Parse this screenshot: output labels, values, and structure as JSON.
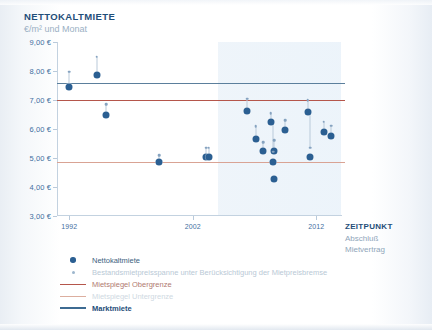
{
  "header": {
    "title": "NETTOKALTMIETE",
    "subtitle": "€/m² und Monat"
  },
  "x_axis_caption": {
    "title": "ZEITPUNKT",
    "line2": "Abschluß",
    "line3": "Mietvertrag"
  },
  "legend": {
    "items": [
      {
        "label": "Nettokaltmiete",
        "marker": "dot",
        "color": "#2b5f92"
      },
      {
        "label": "Bestandsmietpreisspanne unter Berücksichtigung der Mietpreisbremse",
        "marker": "small-dot",
        "color": "#9db6cd"
      },
      {
        "label": "Mietspiegel Obergrenze",
        "marker": "line",
        "color": "#b5564b"
      },
      {
        "label": "Mietspiegel Untergrenze",
        "marker": "line",
        "color": "#dcae9f"
      },
      {
        "label": "Marktmiete",
        "marker": "line",
        "color": "#3d6b92"
      }
    ]
  },
  "chart_data": {
    "type": "scatter",
    "title": "NETTOKALTMIETE",
    "subtitle": "€/m² und Monat",
    "xlabel": "ZEITPUNKT Abschluß Mietvertrag",
    "ylabel": "€/m² und Monat",
    "xlim": [
      1991,
      2014
    ],
    "ylim": [
      3.0,
      9.0
    ],
    "ytick_labels": [
      "3,00 €",
      "4,00 €",
      "5,00 €",
      "6,00 €",
      "7,00 €",
      "8,00 €",
      "9,00 €"
    ],
    "ytick_values": [
      3,
      4,
      5,
      6,
      7,
      8,
      9
    ],
    "xtick_labels": [
      "1992",
      "2002",
      "2012"
    ],
    "xtick_values": [
      1992,
      2002,
      2012
    ],
    "grid": false,
    "legend_position": "below",
    "reference_lines": [
      {
        "name": "Marktmiete",
        "value": 7.6,
        "color": "#3d6b92"
      },
      {
        "name": "Mietspiegel Obergrenze",
        "value": 7.0,
        "color": "#b5564b"
      },
      {
        "name": "Mietspiegel Untergrenze",
        "value": 4.85,
        "color": "#dcae9f"
      }
    ],
    "shaded_region": {
      "from": 2004,
      "to": 2014,
      "color": "#e4eef7"
    },
    "series": [
      {
        "name": "Nettokaltmiete",
        "color": "#2b5f92",
        "points": [
          {
            "x": 1992.0,
            "y": 7.45
          },
          {
            "x": 1994.2,
            "y": 7.85
          },
          {
            "x": 1995.0,
            "y": 6.47
          },
          {
            "x": 1999.3,
            "y": 4.87
          },
          {
            "x": 2003.1,
            "y": 5.05
          },
          {
            "x": 2003.3,
            "y": 5.05
          },
          {
            "x": 2006.4,
            "y": 6.63
          },
          {
            "x": 2007.1,
            "y": 5.65
          },
          {
            "x": 2007.7,
            "y": 5.25
          },
          {
            "x": 2008.3,
            "y": 6.25
          },
          {
            "x": 2008.6,
            "y": 5.25
          },
          {
            "x": 2008.5,
            "y": 4.85
          },
          {
            "x": 2008.6,
            "y": 4.28
          },
          {
            "x": 2009.5,
            "y": 5.98
          },
          {
            "x": 2011.3,
            "y": 6.57
          },
          {
            "x": 2011.5,
            "y": 5.02
          },
          {
            "x": 2012.6,
            "y": 5.88
          },
          {
            "x": 2013.2,
            "y": 5.75
          }
        ]
      },
      {
        "name": "Bestandsmietpreisspanne unter Berücksichtigung der Mietpreisbremse",
        "color": "#86a3c0",
        "points": [
          {
            "x": 1992.0,
            "y": 7.97
          },
          {
            "x": 1994.2,
            "y": 8.5
          },
          {
            "x": 1995.0,
            "y": 6.85
          },
          {
            "x": 1999.3,
            "y": 5.1
          },
          {
            "x": 2003.1,
            "y": 5.35
          },
          {
            "x": 2003.3,
            "y": 5.35
          },
          {
            "x": 2006.4,
            "y": 7.05
          },
          {
            "x": 2007.1,
            "y": 6.1
          },
          {
            "x": 2007.7,
            "y": 5.55
          },
          {
            "x": 2008.3,
            "y": 6.55
          },
          {
            "x": 2008.6,
            "y": 5.62
          },
          {
            "x": 2008.5,
            "y": 5.22
          },
          {
            "x": 2009.5,
            "y": 6.3
          },
          {
            "x": 2011.3,
            "y": 7.0
          },
          {
            "x": 2011.5,
            "y": 5.35
          },
          {
            "x": 2012.6,
            "y": 6.25
          },
          {
            "x": 2013.2,
            "y": 6.12
          }
        ]
      }
    ]
  }
}
